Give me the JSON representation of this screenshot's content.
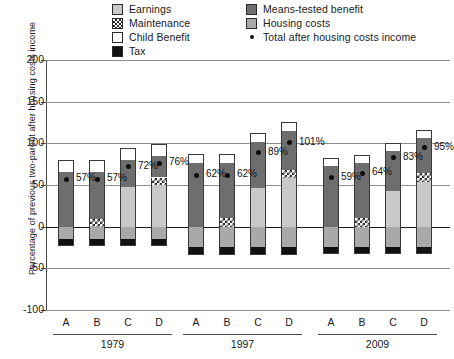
{
  "chart_data": {
    "type": "bar",
    "title": "",
    "xlabel": "",
    "ylabel": "Percentage of previous two-parent after housing costs income",
    "ylim": [
      -100,
      200
    ],
    "yticks": [
      200,
      150,
      100,
      50,
      0,
      -50,
      -100
    ],
    "grid": true,
    "legend_position": "top",
    "stacked": true,
    "groups": [
      {
        "label": "1979",
        "categories": [
          "A",
          "B",
          "C",
          "D"
        ]
      },
      {
        "label": "1997",
        "categories": [
          "A",
          "B",
          "C",
          "D"
        ]
      },
      {
        "label": "2009",
        "categories": [
          "A",
          "B",
          "C",
          "D"
        ]
      }
    ],
    "categories": [
      "1979 A",
      "1979 B",
      "1979 C",
      "1979 D",
      "1997 A",
      "1997 B",
      "1997 C",
      "1997 D",
      "2009 A",
      "2009 B",
      "2009 C",
      "2009 D"
    ],
    "series": [
      {
        "name": "Earnings",
        "color": "#c9c9c9",
        "values": [
          0,
          0,
          48,
          50,
          0,
          0,
          46,
          58,
          0,
          0,
          43,
          54
        ]
      },
      {
        "name": "Maintenance",
        "color": "#ffffff",
        "values": [
          0,
          9,
          0,
          9,
          0,
          10,
          0,
          10,
          0,
          10,
          0,
          10
        ]
      },
      {
        "name": "Means-tested benefit",
        "color": "#6e6e6e",
        "values": [
          66,
          57,
          32,
          26,
          76,
          66,
          56,
          47,
          73,
          66,
          48,
          42
        ]
      },
      {
        "name": "Child Benefit",
        "color": "#ffffff",
        "values": [
          14,
          14,
          14,
          14,
          11,
          11,
          11,
          11,
          10,
          10,
          10,
          10
        ]
      },
      {
        "name": "Housing costs",
        "color": "#a9a9a9",
        "values": [
          -15,
          -15,
          -15,
          -15,
          -24,
          -24,
          -24,
          -24,
          -24,
          -24,
          -24,
          -24
        ]
      },
      {
        "name": "Tax",
        "color": "#111111",
        "values": [
          -8,
          -8,
          -8,
          -8,
          -10,
          -10,
          -10,
          -10,
          -9,
          -9,
          -9,
          -9
        ]
      }
    ],
    "marker_series": {
      "name": "Total after housing costs income",
      "marker": "dot",
      "color": "#0d0d0d",
      "values": [
        57,
        57,
        72,
        76,
        62,
        62,
        89,
        101,
        59,
        64,
        83,
        95
      ],
      "labels": [
        "57%",
        "57%",
        "72%",
        "76%",
        "62%",
        "62%",
        "89%",
        "101%",
        "59%",
        "64%",
        "83%",
        "95%"
      ]
    }
  },
  "legend": {
    "left_column": [
      {
        "label": "Earnings",
        "swatch": "earnings-swatch"
      },
      {
        "label": "Maintenance",
        "swatch": "maintenance-swatch"
      },
      {
        "label": "Child Benefit",
        "swatch": "child-benefit-swatch"
      },
      {
        "label": "Tax",
        "swatch": "tax-swatch"
      }
    ],
    "right_column": [
      {
        "label": "Means-tested benefit",
        "swatch": "means-tested-benefit-swatch"
      },
      {
        "label": "Housing costs",
        "swatch": "housing-costs-swatch"
      },
      {
        "label": "Total after housing costs income",
        "swatch": "total-income-dot-marker"
      }
    ]
  },
  "axis": {
    "y_label": "Percentage of previous two-parent after housing costs income",
    "y_ticks": [
      "200",
      "150",
      "100",
      "50",
      "0",
      "-50",
      "-100"
    ]
  }
}
